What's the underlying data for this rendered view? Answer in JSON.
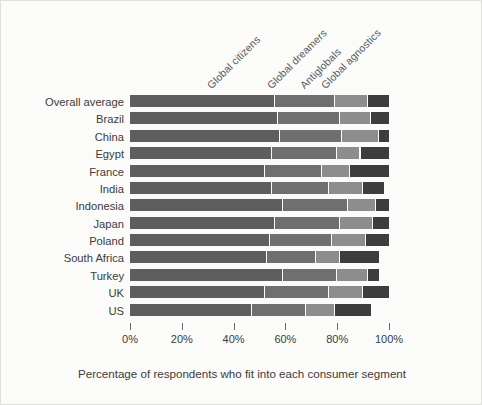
{
  "chart_data": {
    "type": "bar",
    "orientation": "horizontal",
    "stacked": true,
    "title": "",
    "xlabel": "Percentage of respondents who fit into each consumer segment",
    "ylabel": "",
    "xlim": [
      0,
      105
    ],
    "xticks": [
      0,
      20,
      40,
      60,
      80,
      100
    ],
    "xtick_labels": [
      "0%",
      "20%",
      "40%",
      "60%",
      "80%",
      "100%"
    ],
    "grid": false,
    "legend_position": "top-rotated-annotations",
    "categories": [
      "Overall average",
      "Brazil",
      "China",
      "Egypt",
      "France",
      "India",
      "Indonesia",
      "Japan",
      "Poland",
      "South Africa",
      "Turkey",
      "UK",
      "US"
    ],
    "series": [
      {
        "name": "Global citizens",
        "color": "#5e5e5e",
        "values": [
          56,
          57,
          58,
          55,
          52,
          55,
          59,
          56,
          54,
          53,
          59,
          52,
          47
        ]
      },
      {
        "name": "Global dreamers",
        "color": "#6f6f6f",
        "values": [
          23,
          24,
          24,
          25,
          22,
          22,
          25,
          25,
          24,
          19,
          21,
          25,
          21
        ]
      },
      {
        "name": "Antiglobals",
        "color": "#8d8d8d",
        "values": [
          13,
          12,
          14,
          9,
          11,
          13,
          11,
          13,
          13,
          9,
          12,
          13,
          11
        ]
      },
      {
        "name": "Global agnostics",
        "color": "#3d3d3d",
        "values": [
          8,
          7,
          4,
          11,
          15,
          8,
          5,
          6,
          9,
          15,
          4,
          10,
          14
        ]
      }
    ],
    "annotations": [
      {
        "text": "Global citizens",
        "x": 56
      },
      {
        "text": "Global dreamers",
        "x": 79
      },
      {
        "text": "Antiglobals",
        "x": 92
      },
      {
        "text": "Global agnostics",
        "x": 100
      }
    ],
    "colors": {
      "background": "#fbfbfa",
      "border": "#dfdfdc",
      "text": "#3c3c3c",
      "annotation_text": "#5a5a5a",
      "tick": "#6a6a6a"
    }
  }
}
